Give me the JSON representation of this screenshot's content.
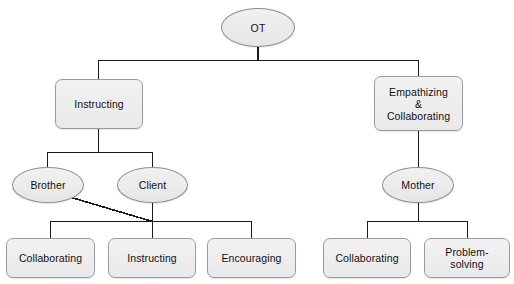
{
  "diagram": {
    "type": "tree",
    "title": "OT",
    "canvas": {
      "width": 514,
      "height": 284
    },
    "palette": {
      "background": "#ffffff",
      "node_fill": "#ececec",
      "node_border": "#9a9a9a",
      "edge_color": "#1a1a1a",
      "text_color": "#111111"
    },
    "nodes": [
      {
        "id": "ot",
        "label": "OT",
        "shape": "ellipse",
        "level": 0,
        "x": 221,
        "y": 8,
        "w": 74,
        "h": 39
      },
      {
        "id": "instructing-branch",
        "label": "Instructing",
        "shape": "box",
        "level": 1,
        "x": 55,
        "y": 79,
        "w": 88,
        "h": 50
      },
      {
        "id": "empathizing-collaborating-branch",
        "label": "Empathizing\n&\nCollaborating",
        "shape": "box",
        "level": 1,
        "x": 374,
        "y": 76,
        "w": 89,
        "h": 55
      },
      {
        "id": "brother",
        "label": "Brother",
        "shape": "ellipse",
        "level": 2,
        "x": 12,
        "y": 167,
        "w": 72,
        "h": 36
      },
      {
        "id": "client",
        "label": "Client",
        "shape": "ellipse",
        "level": 2,
        "x": 117,
        "y": 167,
        "w": 71,
        "h": 36
      },
      {
        "id": "mother",
        "label": "Mother",
        "shape": "ellipse",
        "level": 2,
        "x": 382,
        "y": 167,
        "w": 72,
        "h": 36
      },
      {
        "id": "leaf-collaborating-left",
        "label": "Collaborating",
        "shape": "box",
        "level": 3,
        "x": 6,
        "y": 238,
        "w": 89,
        "h": 40
      },
      {
        "id": "leaf-instructing",
        "label": "Instructing",
        "shape": "box",
        "level": 3,
        "x": 108,
        "y": 238,
        "w": 88,
        "h": 40
      },
      {
        "id": "leaf-encouraging",
        "label": "Encouraging",
        "shape": "box",
        "level": 3,
        "x": 207,
        "y": 238,
        "w": 89,
        "h": 40
      },
      {
        "id": "leaf-collaborating-right",
        "label": "Collaborating",
        "shape": "box",
        "level": 3,
        "x": 323,
        "y": 238,
        "w": 88,
        "h": 40
      },
      {
        "id": "leaf-problem-solving",
        "label": "Problem-\nsolving",
        "shape": "box",
        "level": 3,
        "x": 424,
        "y": 238,
        "w": 86,
        "h": 40
      }
    ],
    "edges": [
      {
        "from": "ot",
        "to": "instructing-branch",
        "style": "orthogonal"
      },
      {
        "from": "ot",
        "to": "empathizing-collaborating-branch",
        "style": "orthogonal"
      },
      {
        "from": "instructing-branch",
        "to": "brother",
        "style": "orthogonal"
      },
      {
        "from": "instructing-branch",
        "to": "client",
        "style": "orthogonal"
      },
      {
        "from": "empathizing-collaborating-branch",
        "to": "mother",
        "style": "orthogonal"
      },
      {
        "from": "brother",
        "to": "leaf-junction",
        "style": "diagonal"
      },
      {
        "from": "client",
        "to": "leaf-collaborating-left",
        "style": "orthogonal"
      },
      {
        "from": "client",
        "to": "leaf-instructing",
        "style": "orthogonal"
      },
      {
        "from": "client",
        "to": "leaf-encouraging",
        "style": "orthogonal"
      },
      {
        "from": "mother",
        "to": "leaf-collaborating-right",
        "style": "orthogonal"
      },
      {
        "from": "mother",
        "to": "leaf-problem-solving",
        "style": "orthogonal"
      }
    ]
  }
}
